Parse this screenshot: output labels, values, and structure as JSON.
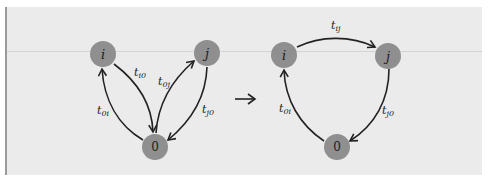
{
  "figure": {
    "colors": {
      "background": "#ebebeb",
      "node_fill": "#8f8f8f",
      "edge": "#222222"
    },
    "left_graph": {
      "nodes": [
        {
          "id": "i",
          "label": "i"
        },
        {
          "id": "j",
          "label": "j"
        },
        {
          "id": "0",
          "label": "0"
        }
      ],
      "edges": [
        {
          "from": "0",
          "to": "i",
          "label": "t",
          "sub": "0i"
        },
        {
          "from": "i",
          "to": "0",
          "label": "t",
          "sub": "i0"
        },
        {
          "from": "0",
          "to": "j",
          "label": "t",
          "sub": "0j"
        },
        {
          "from": "j",
          "to": "0",
          "label": "t",
          "sub": "j0"
        }
      ]
    },
    "transform_arrow": "→",
    "right_graph": {
      "nodes": [
        {
          "id": "i",
          "label": "i"
        },
        {
          "id": "j",
          "label": "j"
        },
        {
          "id": "0",
          "label": "0"
        }
      ],
      "edges": [
        {
          "from": "i",
          "to": "j",
          "label": "t",
          "sub": "ij"
        },
        {
          "from": "j",
          "to": "0",
          "label": "t",
          "sub": "j0"
        },
        {
          "from": "0",
          "to": "i",
          "label": "t",
          "sub": "0i"
        }
      ]
    }
  }
}
